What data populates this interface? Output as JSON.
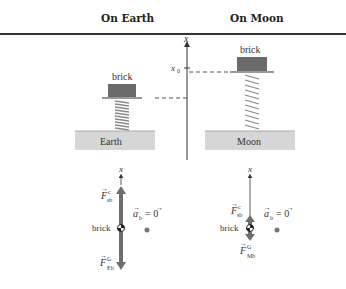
{
  "headers": {
    "earth": "On Earth",
    "moon": "On Moon"
  },
  "scene": {
    "axis_label": "x",
    "x0_label": "x",
    "x0_subscript": "0",
    "earth": {
      "brick_label": "brick",
      "ground_label": "Earth"
    },
    "moon": {
      "brick_label": "brick",
      "ground_label": "Moon"
    }
  },
  "free_body": {
    "earth": {
      "axis_label": "x",
      "object_label": "brick",
      "upper_force": {
        "symbol": "F",
        "superscript": "c",
        "subscript": "sb"
      },
      "lower_force": {
        "symbol": "F",
        "superscript": "G",
        "subscript": "Eb"
      },
      "acceleration": {
        "symbol": "a",
        "subscript": "b",
        "equals": "= 0"
      }
    },
    "moon": {
      "axis_label": "x",
      "object_label": "brick",
      "upper_force": {
        "symbol": "F",
        "superscript": "c",
        "subscript": "sb"
      },
      "lower_force": {
        "symbol": "F",
        "superscript": "G",
        "subscript": "Mb"
      },
      "acceleration": {
        "symbol": "a",
        "subscript": "b",
        "equals": "= 0"
      }
    }
  },
  "colors": {
    "brick": "#6b6b6b",
    "ground": "#d6d6d6",
    "force_arrow": "#6e6e6e",
    "spring": "#8a8a8a",
    "rule": "#333333"
  }
}
